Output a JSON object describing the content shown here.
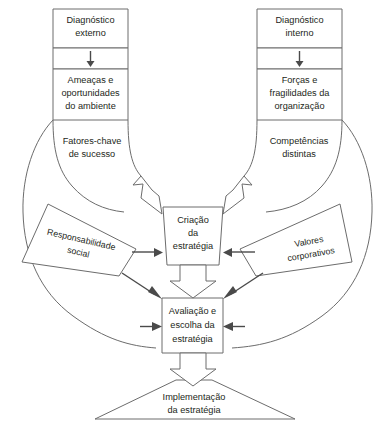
{
  "diagram": {
    "colors": {
      "stroke": "#6c6c6c",
      "arrow": "#4a4a4a",
      "text": "#231f20",
      "background": "#ffffff"
    },
    "nodes": {
      "diagnostico_externo": {
        "line1": "Diagnóstico",
        "line2": "externo"
      },
      "ameacas": {
        "line1": "Ameaças e",
        "line2": "oportunidades",
        "line3": "do ambiente"
      },
      "fatores_chave": {
        "line1": "Fatores-chave",
        "line2": "de sucesso"
      },
      "diagnostico_interno": {
        "line1": "Diagnóstico",
        "line2": "interno"
      },
      "forcas": {
        "line1": "Forças e",
        "line2": "fragilidades da",
        "line3": "organização"
      },
      "competencias": {
        "line1": "Competências",
        "line2": "distintas"
      },
      "responsabilidade_social": {
        "line1": "Responsabilidade",
        "line2": "social"
      },
      "valores_corporativos": {
        "line1": "Valores",
        "line2": "corporativos"
      },
      "criacao_estrategia": {
        "line1": "Criação",
        "line2": "da",
        "line3": "estratégia"
      },
      "avaliacao_escolha": {
        "line1": "Avaliação e",
        "line2": "escolha da",
        "line3": "estratégia"
      },
      "implementacao": {
        "line1": "Implementação",
        "line2": "da estratégia"
      }
    }
  }
}
